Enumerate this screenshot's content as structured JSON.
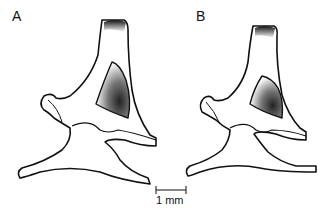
{
  "figure": {
    "panels": [
      {
        "label": "A"
      },
      {
        "label": "B"
      }
    ],
    "scale_bar": {
      "label": "1 mm"
    }
  }
}
